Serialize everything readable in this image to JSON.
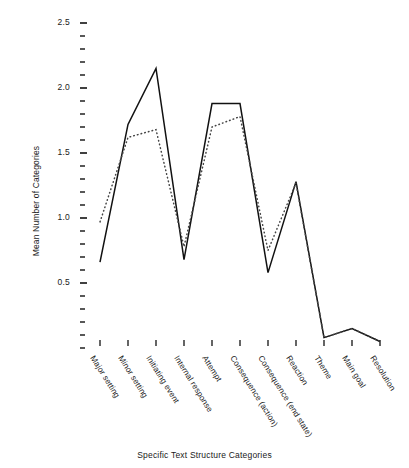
{
  "chart_data": {
    "type": "line",
    "title": "",
    "xlabel": "Specific Text Structure Categories",
    "ylabel": "Mean Number of Categories",
    "categories": [
      "Major setting",
      "Minor setting",
      "Initiating event",
      "Internal response",
      "Attempt",
      "Consequence (action)",
      "Consequence (end state)",
      "Reaction",
      "Theme",
      "Main goal",
      "Resolution"
    ],
    "ylim": [
      0.0,
      2.6
    ],
    "ytick_labels": [
      "0.5",
      "1.0",
      "1.5",
      "2.0",
      "2.5"
    ],
    "ytick_values": [
      0.5,
      1.0,
      1.5,
      2.0,
      2.5
    ],
    "yminor_step": 0.1,
    "grid": false,
    "legend_position": "none",
    "series": [
      {
        "name": "solid-line",
        "style": "solid",
        "color": "#111111",
        "values": [
          0.66,
          1.72,
          2.15,
          0.68,
          1.88,
          1.88,
          0.58,
          1.28,
          0.08,
          0.15,
          0.05
        ]
      },
      {
        "name": "dotted-line",
        "style": "dotted",
        "color": "#444444",
        "values": [
          0.97,
          1.62,
          1.68,
          0.78,
          1.7,
          1.78,
          0.75,
          1.27,
          0.08,
          0.15,
          0.05
        ]
      }
    ]
  },
  "axes": {
    "y_axis_label": "Mean Number of Categories",
    "x_axis_label": "Specific Text Structure Categories"
  }
}
